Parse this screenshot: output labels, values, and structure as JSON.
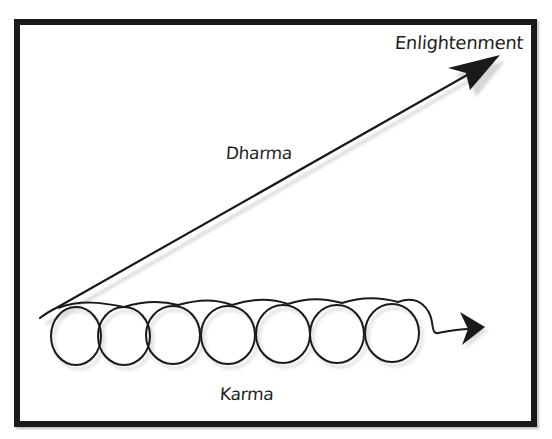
{
  "diagram": {
    "labels": {
      "enlightenment": "Enlightenment",
      "dharma": "Dharma",
      "karma": "Karma"
    },
    "paths": [
      {
        "name": "dharma-path",
        "shape": "straight-arrow",
        "direction": "up-right",
        "leads_to": "Enlightenment"
      },
      {
        "name": "karma-path",
        "shape": "looping-arrow",
        "loop_count": 7,
        "direction": "right"
      }
    ],
    "colors": {
      "stroke": "#1a1a1a",
      "background": "#ffffff",
      "shadow": "#c8c8c8"
    }
  }
}
